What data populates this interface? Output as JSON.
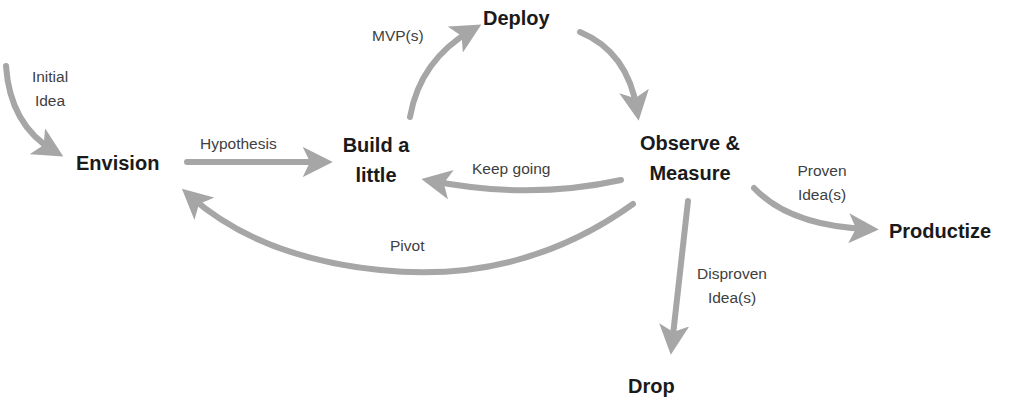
{
  "diagram": {
    "type": "flow",
    "arrow_color": "#a6a6a6",
    "text_color": "#1a1a1a",
    "label_color": "#404040",
    "nodes": {
      "envision": "Envision",
      "build_line1": "Build a",
      "build_line2": "little",
      "deploy": "Deploy",
      "observe_line1": "Observe &",
      "observe_line2": "Measure",
      "productize": "Productize",
      "drop": "Drop"
    },
    "edges": {
      "initial_idea_line1": "Initial",
      "initial_idea_line2": "Idea",
      "hypothesis": "Hypothesis",
      "mvps": "MVP(s)",
      "keep_going": "Keep going",
      "pivot": "Pivot",
      "proven_line1": "Proven",
      "proven_line2": "Idea(s)",
      "disproven_line1": "Disproven",
      "disproven_line2": "Idea(s)"
    },
    "flow": [
      {
        "from": "start",
        "to": "Envision",
        "label": "Initial Idea"
      },
      {
        "from": "Envision",
        "to": "Build a little",
        "label": "Hypothesis"
      },
      {
        "from": "Build a little",
        "to": "Deploy",
        "label": "MVP(s)"
      },
      {
        "from": "Deploy",
        "to": "Observe & Measure",
        "label": ""
      },
      {
        "from": "Observe & Measure",
        "to": "Build a little",
        "label": "Keep going"
      },
      {
        "from": "Observe & Measure",
        "to": "Envision",
        "label": "Pivot"
      },
      {
        "from": "Observe & Measure",
        "to": "Productize",
        "label": "Proven Idea(s)"
      },
      {
        "from": "Observe & Measure",
        "to": "Drop",
        "label": "Disproven Idea(s)"
      }
    ]
  }
}
